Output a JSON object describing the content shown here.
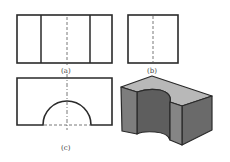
{
  "figure": {
    "views": [
      {
        "id": "a",
        "label": "(a)",
        "name": "front view"
      },
      {
        "id": "b",
        "label": "(b)",
        "name": "side view"
      },
      {
        "id": "c",
        "label": "(c)",
        "name": "top view with semicircular cutout"
      }
    ],
    "isometric": {
      "name": "isometric solid with semicircular groove"
    },
    "colors": {
      "line": "#2a2a2a",
      "solid_front": "#7d7d7d",
      "solid_side": "#6a6a6a",
      "solid_top": "#b8b8b8",
      "solid_inner": "#5a5a5a"
    }
  }
}
